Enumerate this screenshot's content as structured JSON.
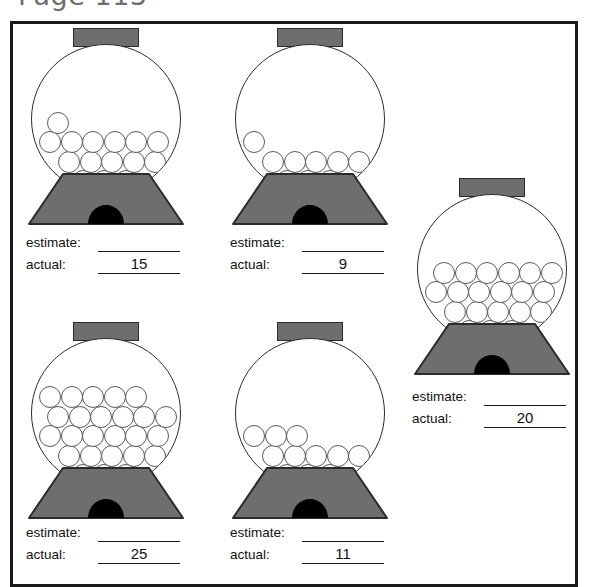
{
  "page": {
    "title": "Page 113",
    "background_color": "#ffffff",
    "frame_color": "#1a1a1a"
  },
  "colors": {
    "lid_fill": "#6e6e6e",
    "base_fill": "#6e6e6e",
    "dispenser_fill": "#000000",
    "outline": "#2b2b2b",
    "gumball_outline": "#5a5a5a",
    "gumball_fill": "#ffffff"
  },
  "labels": {
    "estimate": "estimate:",
    "actual": "actual:",
    "estimate_value": ""
  },
  "machines": [
    {
      "id": "machine-1",
      "position": "top-left",
      "estimate": "",
      "actual": "15",
      "gumball_count": 15
    },
    {
      "id": "machine-2",
      "position": "top-middle",
      "estimate": "",
      "actual": "9",
      "gumball_count": 9
    },
    {
      "id": "machine-3",
      "position": "right",
      "estimate": "",
      "actual": "20",
      "gumball_count": 20
    },
    {
      "id": "machine-4",
      "position": "bottom-left",
      "estimate": "",
      "actual": "25",
      "gumball_count": 25
    },
    {
      "id": "machine-5",
      "position": "bottom-middle",
      "estimate": "",
      "actual": "11",
      "gumball_count": 11
    }
  ]
}
